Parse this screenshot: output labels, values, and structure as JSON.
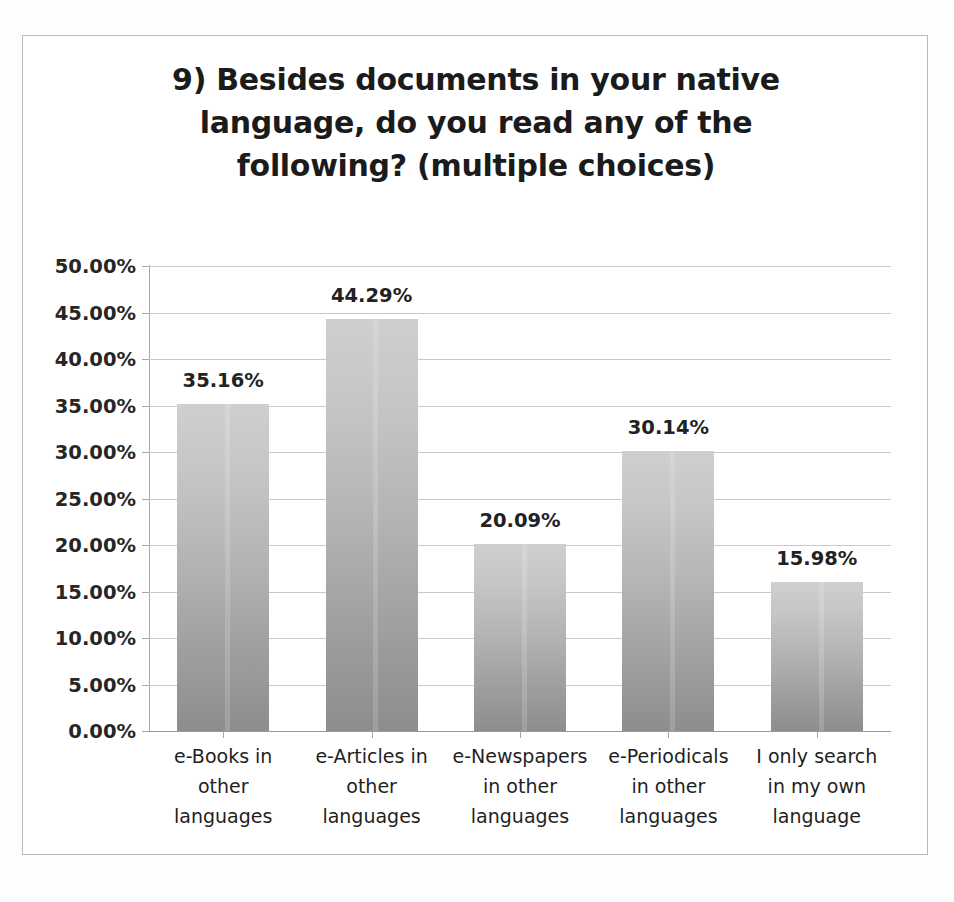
{
  "chart_data": {
    "type": "bar",
    "title": "9) Besides documents in your native language, do you read any of the following? (multiple choices)",
    "title_lines": [
      "9) Besides documents in your native",
      "language, do you read any of the",
      "following? (multiple choices)"
    ],
    "categories": [
      "e-Books in other languages",
      "e-Articles in other languages",
      "e-Newspapers in other languages",
      "e-Periodicals in other languages",
      "I only search in my own language"
    ],
    "category_lines": [
      [
        "e-Books in",
        "other",
        "languages"
      ],
      [
        "e-Articles in",
        "other",
        "languages"
      ],
      [
        "e-Newspapers",
        "in other",
        "languages"
      ],
      [
        "e-Periodicals",
        "in other",
        "languages"
      ],
      [
        "I only search",
        "in my own",
        "language"
      ]
    ],
    "values": [
      35.16,
      44.29,
      20.09,
      30.14,
      15.98
    ],
    "value_labels": [
      "35.16%",
      "44.29%",
      "20.09%",
      "30.14%",
      "15.98%"
    ],
    "xlabel": "",
    "ylabel": "",
    "ylim": [
      0,
      50
    ],
    "ytick_step": 5,
    "ytick_labels": [
      "50.00%",
      "45.00%",
      "40.00%",
      "35.00%",
      "30.00%",
      "25.00%",
      "20.00%",
      "15.00%",
      "10.00%",
      "5.00%",
      "0.00%"
    ],
    "ytick_values": [
      50,
      45,
      40,
      35,
      30,
      25,
      20,
      15,
      10,
      5,
      0
    ],
    "grid": true,
    "legend": false,
    "legend_position": "none",
    "bar_color_top": "#cfcfcf",
    "bar_color_bottom": "#8d8d8d",
    "gridline_color": "#c9c9c9",
    "axis_color": "#a8a8a8",
    "text_color": "#222222",
    "plot_background": "#ffffff",
    "frame_border_color": "#b9b9b9"
  }
}
